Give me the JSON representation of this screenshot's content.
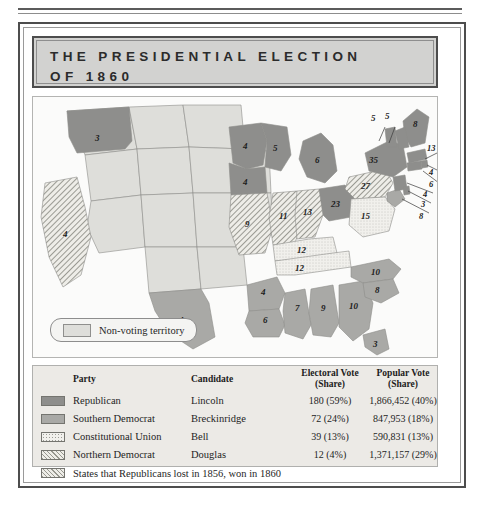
{
  "title": {
    "line1": "THE  PRESIDENTIAL  ELECTION",
    "line2": "OF  1860"
  },
  "map": {
    "non_voting_label": "Non-voting territory",
    "state_labels": [
      {
        "name": "oregon",
        "value": "3"
      },
      {
        "name": "california",
        "value": "4"
      },
      {
        "name": "minnesota",
        "value": "4"
      },
      {
        "name": "iowa",
        "value": "4"
      },
      {
        "name": "wisconsin",
        "value": "5"
      },
      {
        "name": "michigan",
        "value": "6"
      },
      {
        "name": "missouri",
        "value": "9"
      },
      {
        "name": "illinois",
        "value": "11"
      },
      {
        "name": "indiana",
        "value": "13"
      },
      {
        "name": "ohio",
        "value": "23"
      },
      {
        "name": "kentucky",
        "value": "12"
      },
      {
        "name": "tennessee",
        "value": "12"
      },
      {
        "name": "virginia",
        "value": "15"
      },
      {
        "name": "north-carolina",
        "value": "10"
      },
      {
        "name": "south-carolina",
        "value": "8"
      },
      {
        "name": "georgia",
        "value": "10"
      },
      {
        "name": "florida",
        "value": "3"
      },
      {
        "name": "alabama",
        "value": "9"
      },
      {
        "name": "mississippi",
        "value": "7"
      },
      {
        "name": "louisiana",
        "value": "6"
      },
      {
        "name": "arkansas",
        "value": "4"
      },
      {
        "name": "texas",
        "value": "4"
      },
      {
        "name": "new-hampshire",
        "value": "5"
      },
      {
        "name": "vermont",
        "value": "5"
      },
      {
        "name": "maine",
        "value": "8"
      },
      {
        "name": "new-york",
        "value": "35"
      },
      {
        "name": "massachusetts",
        "value": "13"
      },
      {
        "name": "rhode-island",
        "value": "4"
      },
      {
        "name": "connecticut",
        "value": "6"
      },
      {
        "name": "pennsylvania",
        "value": "27"
      },
      {
        "name": "new-jersey",
        "value": "4"
      },
      {
        "name": "delaware",
        "value": "3"
      },
      {
        "name": "maryland",
        "value": "8"
      }
    ]
  },
  "legend": {
    "headers": {
      "party": "Party",
      "candidate": "Candidate",
      "electoral_l1": "Electoral Vote",
      "electoral_l2": "(Share)",
      "popular_l1": "Popular Vote",
      "popular_l2": "(Share)"
    },
    "rows": [
      {
        "party": "Republican",
        "candidate": "Lincoln",
        "electoral": "180 (59%)",
        "popular": "1,866,452 (40%)"
      },
      {
        "party": "Southern Democrat",
        "candidate": "Breckinridge",
        "electoral": "72 (24%)",
        "popular": "847,953 (18%)"
      },
      {
        "party": "Constitutional Union",
        "candidate": "Bell",
        "electoral": "39 (13%)",
        "popular": "590,831 (13%)"
      },
      {
        "party": "Northern Democrat",
        "candidate": "Douglas",
        "electoral": "12 (4%)",
        "popular": "1,371,157 (29%)"
      }
    ],
    "note": "States that Republicans lost in 1856, won in 1860"
  },
  "colors": {
    "republican": "#8e8e8c",
    "southern_democrat": "#a9a9a6",
    "constitutional_union": "#f1f0ec",
    "northern_democrat": "#eeede8",
    "non_voting": "#dededa",
    "title_bg": "#d2d2d0",
    "legend_bg": "#eceae6"
  }
}
